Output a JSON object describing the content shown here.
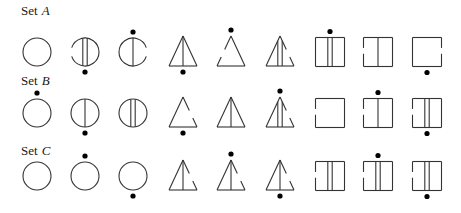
{
  "colors": {
    "stroke": "#333333",
    "dot": "#000000",
    "background": "#ffffff"
  },
  "sets": [
    {
      "name": "Set",
      "letter": "A",
      "label_y": 4,
      "center_y": 52,
      "figures": [
        {
          "shape": "circle",
          "lines": 0,
          "gap": "none",
          "dot": "none"
        },
        {
          "shape": "circle",
          "lines": 2,
          "gap": "left",
          "dot": "bottom"
        },
        {
          "shape": "circle",
          "lines": 1,
          "gap": "right",
          "dot": "top"
        },
        {
          "shape": "triangle",
          "lines": 1,
          "gap": "none",
          "dot": "bottom"
        },
        {
          "shape": "triangle",
          "lines": 0,
          "gap": "left",
          "dot": "top"
        },
        {
          "shape": "triangle",
          "lines": 2,
          "gap": "right",
          "dot": "none"
        },
        {
          "shape": "square",
          "lines": 2,
          "gap": "none",
          "dot": "top"
        },
        {
          "shape": "square",
          "lines": 1,
          "gap": "left",
          "dot": "none"
        },
        {
          "shape": "square",
          "lines": 0,
          "gap": "right",
          "dot": "bottom"
        }
      ]
    },
    {
      "name": "Set",
      "letter": "B",
      "label_y": 74,
      "center_y": 113,
      "figures": [
        {
          "shape": "circle",
          "lines": 0,
          "gap": "none",
          "dot": "top"
        },
        {
          "shape": "circle",
          "lines": 1,
          "gap": "none",
          "dot": "bottom"
        },
        {
          "shape": "circle",
          "lines": 2,
          "gap": "none",
          "dot": "none"
        },
        {
          "shape": "triangle",
          "lines": 0,
          "gap": "right",
          "dot": "bottom"
        },
        {
          "shape": "triangle",
          "lines": 1,
          "gap": "none",
          "dot": "none"
        },
        {
          "shape": "triangle",
          "lines": 2,
          "gap": "right",
          "dot": "top"
        },
        {
          "shape": "square",
          "lines": 0,
          "gap": "left",
          "dot": "none"
        },
        {
          "shape": "square",
          "lines": 1,
          "gap": "left",
          "dot": "top"
        },
        {
          "shape": "square",
          "lines": 2,
          "gap": "left",
          "dot": "bottom"
        }
      ]
    },
    {
      "name": "Set",
      "letter": "C",
      "label_y": 144,
      "center_y": 176,
      "figures": [
        {
          "shape": "circle",
          "lines": 0,
          "gap": "none",
          "dot": "none"
        },
        {
          "shape": "circle",
          "lines": 0,
          "gap": "none",
          "dot": "top"
        },
        {
          "shape": "circle",
          "lines": 0,
          "gap": "none",
          "dot": "bottom"
        },
        {
          "shape": "triangle",
          "lines": 1,
          "gap": "right",
          "dot": "none"
        },
        {
          "shape": "triangle",
          "lines": 1,
          "gap": "right",
          "dot": "top"
        },
        {
          "shape": "triangle",
          "lines": 1,
          "gap": "right",
          "dot": "bottom"
        },
        {
          "shape": "square",
          "lines": 2,
          "gap": "left",
          "dot": "none"
        },
        {
          "shape": "square",
          "lines": 2,
          "gap": "left",
          "dot": "top"
        },
        {
          "shape": "square",
          "lines": 2,
          "gap": "left",
          "dot": "bottom"
        }
      ]
    }
  ],
  "column_x": [
    37,
    85,
    133,
    183,
    231,
    280,
    330,
    378,
    427
  ]
}
